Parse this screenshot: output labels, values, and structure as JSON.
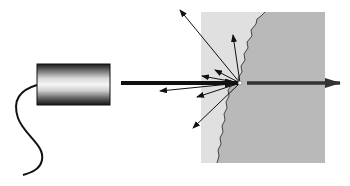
{
  "diagram": {
    "colors": {
      "background": "#ffffff",
      "medium_left": "#e0e0e0",
      "medium_right": "#b9b9b9",
      "beam": "#111111",
      "transmitted_beam": "#333333",
      "source_dark": "#1a1a1a",
      "source_light": "#f4f4f4"
    },
    "source": {
      "label": "light-source-cylinder",
      "x": 37,
      "y": 64,
      "width": 73,
      "height": 41
    },
    "incident_beam": {
      "x1": 121,
      "y1": 83,
      "x2": 238,
      "y2": 83
    },
    "impact_point": {
      "x": 240,
      "y": 83
    },
    "transmitted_beam": {
      "x1": 247,
      "y1": 83,
      "x2": 340,
      "y2": 83
    },
    "scattered_rays": [
      {
        "x": 180,
        "y": 10
      },
      {
        "x": 233,
        "y": 35
      },
      {
        "x": 215,
        "y": 70
      },
      {
        "x": 202,
        "y": 76
      },
      {
        "x": 160,
        "y": 91
      },
      {
        "x": 197,
        "y": 97
      },
      {
        "x": 193,
        "y": 128
      }
    ]
  }
}
